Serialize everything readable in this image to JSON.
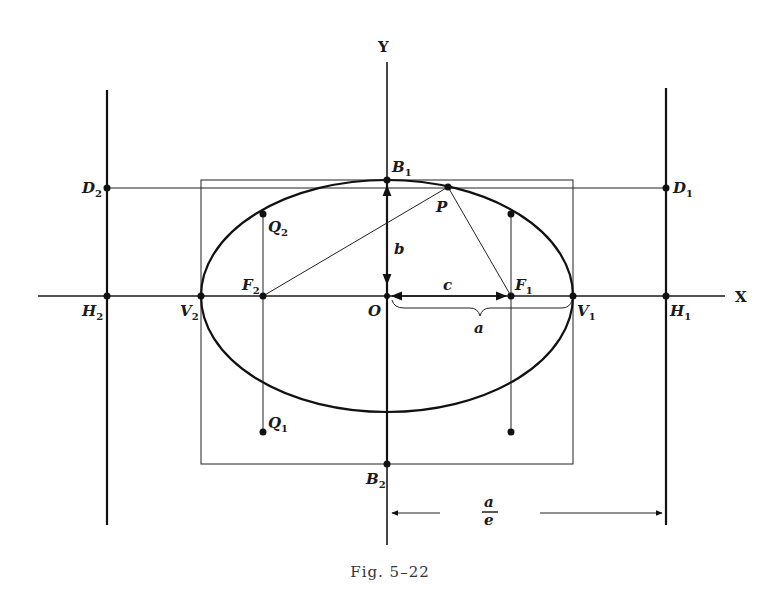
{
  "figure": {
    "caption": "Fig. 5–22",
    "axes": {
      "x_label": "X",
      "y_label": "Y",
      "origin_label": "O"
    },
    "points": {
      "B1": {
        "main": "B",
        "sub": "1"
      },
      "B2": {
        "main": "B",
        "sub": "2"
      },
      "D1": {
        "main": "D",
        "sub": "1"
      },
      "D2": {
        "main": "D",
        "sub": "2"
      },
      "F1": {
        "main": "F",
        "sub": "1"
      },
      "F2": {
        "main": "F",
        "sub": "2"
      },
      "V1": {
        "main": "V",
        "sub": "1"
      },
      "V2": {
        "main": "V",
        "sub": "2"
      },
      "H1": {
        "main": "H",
        "sub": "1"
      },
      "H2": {
        "main": "H",
        "sub": "2"
      },
      "Q1": {
        "main": "Q",
        "sub": "1"
      },
      "Q2": {
        "main": "Q",
        "sub": "2"
      },
      "P": "P"
    },
    "segments": {
      "b": "b",
      "c": "c",
      "a": "a",
      "a_over_e_num": "a",
      "a_over_e_den": "e"
    }
  }
}
